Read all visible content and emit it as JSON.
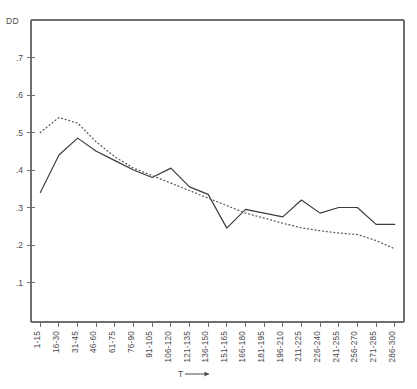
{
  "chart_data": {
    "type": "line",
    "title": "",
    "ylabel": "DD",
    "xlabel": "T",
    "xlabel_arrow": "⟶",
    "grid": false,
    "legend_position": "none",
    "categories": [
      "1-15",
      "16-30",
      "31-45",
      "46-60",
      "61-75",
      "76-90",
      "91-105",
      "106-120",
      "121-135",
      "136-150",
      "151-165",
      "166-180",
      "181-195",
      "196-210",
      "211-225",
      "226-240",
      "241-255",
      "256-270",
      "271-285",
      "286-300"
    ],
    "ylim": [
      0.0,
      0.8
    ],
    "ytick_values": [
      0.7,
      0.6,
      0.5,
      0.4,
      0.3,
      0.2,
      0.1
    ],
    "ytick_labels": [
      ".7",
      ".6",
      ".5",
      ".4",
      ".3",
      ".2",
      ".1"
    ],
    "series": [
      {
        "name": "solid",
        "style": "solid",
        "color": "#3a3a3a",
        "values": [
          0.34,
          0.44,
          0.485,
          0.45,
          0.425,
          0.4,
          0.38,
          0.405,
          0.355,
          0.335,
          0.245,
          0.295,
          0.285,
          0.275,
          0.32,
          0.285,
          0.3,
          0.3,
          0.255,
          0.255
        ]
      },
      {
        "name": "dotted",
        "style": "dotted",
        "color": "#5a5a5a",
        "values": [
          0.5,
          0.54,
          0.525,
          0.475,
          0.435,
          0.405,
          0.385,
          0.365,
          0.345,
          0.325,
          0.305,
          0.285,
          0.272,
          0.258,
          0.246,
          0.238,
          0.232,
          0.228,
          0.212,
          0.19
        ]
      }
    ]
  },
  "geometry": {
    "plot_left": 31,
    "plot_right": 404,
    "plot_top": 20,
    "plot_bottom": 322,
    "y_value_top": 0.8,
    "y_pixels_per_unit": 375
  }
}
